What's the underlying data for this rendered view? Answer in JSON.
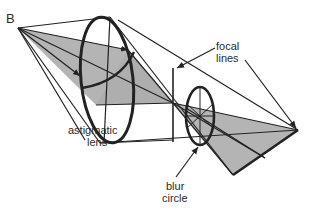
{
  "diagram": {
    "colors": {
      "stroke": "#222222",
      "fill_plane": "#b4b4b4",
      "background": "#ffffff"
    },
    "labels": {
      "point_b": "B",
      "lens_line1": "astigmatic",
      "lens_line2": "lens",
      "focal_line1": "focal",
      "focal_line2": "lines",
      "blur_line1": "blur",
      "blur_line2": "circle"
    }
  }
}
